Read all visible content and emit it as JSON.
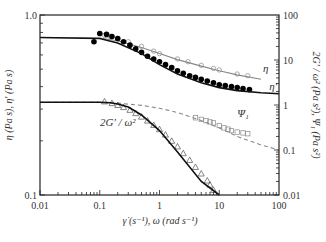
{
  "chart_data": {
    "type": "line",
    "title": "",
    "xlabel": "γ̇ (s⁻¹), ω (rad s⁻¹)",
    "ylabel_left": "η (Pa s), η′ (Pa s)",
    "ylabel_right": "2G′ / ω² (Pa s²), Ψ₁ (Pa s²)",
    "xscale": "log",
    "xlim": [
      0.01,
      100
    ],
    "ylim_left": [
      0.1,
      1.0
    ],
    "ylim_right": [
      0.01,
      100
    ],
    "x_ticks": [
      "0.01",
      "0.1",
      "1",
      "10",
      "100"
    ],
    "y_ticks_left": [
      "0.1",
      "1.0"
    ],
    "y_ticks_right": [
      "0.01",
      "0.1",
      "1",
      "10",
      "100"
    ],
    "grid": false,
    "series": [
      {
        "name": "η",
        "axis": "left",
        "style": "line-gray-with-open-circles",
        "model_x": [
          0.01,
          0.1,
          0.2,
          0.5,
          1,
          2,
          5,
          10,
          20,
          50
        ],
        "model_y": [
          0.75,
          0.745,
          0.72,
          0.66,
          0.61,
          0.565,
          0.52,
          0.49,
          0.465,
          0.44
        ],
        "data_x": [
          0.12,
          0.15,
          0.2,
          0.3,
          0.5,
          0.8,
          1,
          2,
          3,
          5,
          8,
          10,
          20,
          30
        ],
        "data_y": [
          0.77,
          0.76,
          0.74,
          0.71,
          0.67,
          0.63,
          0.61,
          0.57,
          0.55,
          0.525,
          0.505,
          0.495,
          0.47,
          0.46
        ],
        "label": "η"
      },
      {
        "name": "η′",
        "axis": "left",
        "style": "line-black-with-filled-circles",
        "model_x": [
          0.01,
          0.1,
          0.2,
          0.5,
          1,
          2,
          5,
          10,
          20,
          50,
          100
        ],
        "model_y": [
          0.75,
          0.74,
          0.7,
          0.61,
          0.53,
          0.47,
          0.42,
          0.395,
          0.38,
          0.37,
          0.365
        ],
        "data_x": [
          0.08,
          0.1,
          0.13,
          0.16,
          0.2,
          0.25,
          0.32,
          0.4,
          0.5,
          0.63,
          0.8,
          1,
          1.26,
          1.6,
          2,
          2.5,
          3.2,
          4,
          5,
          6.3,
          8,
          10,
          12.6,
          16,
          20,
          25,
          32
        ],
        "data_y": [
          0.71,
          0.79,
          0.78,
          0.76,
          0.74,
          0.71,
          0.68,
          0.65,
          0.62,
          0.59,
          0.57,
          0.55,
          0.53,
          0.51,
          0.49,
          0.475,
          0.46,
          0.45,
          0.44,
          0.43,
          0.42,
          0.41,
          0.405,
          0.4,
          0.395,
          0.39,
          0.385
        ],
        "label": "η′"
      },
      {
        "name": "Ψ₁",
        "axis": "right",
        "style": "dashed-gray-with-open-squares",
        "model_x": [
          0.01,
          0.1,
          0.2,
          0.5,
          1,
          2,
          5,
          10,
          20,
          50,
          100
        ],
        "model_y": [
          1.15,
          1.15,
          1.1,
          0.98,
          0.85,
          0.68,
          0.45,
          0.31,
          0.2,
          0.13,
          0.1
        ],
        "data_x": [
          4,
          5,
          6,
          7,
          8,
          10,
          12,
          14,
          16,
          20,
          25,
          30
        ],
        "data_y": [
          0.52,
          0.48,
          0.45,
          0.42,
          0.4,
          0.35,
          0.31,
          0.29,
          0.27,
          0.25,
          0.24,
          0.23
        ],
        "label": "Ψ₁"
      },
      {
        "name": "2G′/ω²",
        "axis": "right",
        "style": "line-black-with-open-triangles",
        "model_x": [
          0.01,
          0.1,
          0.15,
          0.2,
          0.3,
          0.5,
          1,
          2,
          5,
          10
        ],
        "model_y": [
          1.15,
          1.15,
          1.12,
          1.05,
          0.9,
          0.6,
          0.27,
          0.09,
          0.02,
          0.01
        ],
        "data_x": [
          0.12,
          0.16,
          0.2,
          0.25,
          0.32,
          0.4,
          0.5,
          0.63,
          0.8,
          1,
          1.26,
          1.6,
          2,
          2.5,
          3.2,
          4,
          5,
          6.3,
          7,
          8
        ],
        "data_y": [
          1.2,
          1.1,
          1.0,
          0.9,
          0.78,
          0.66,
          0.55,
          0.45,
          0.36,
          0.29,
          0.22,
          0.16,
          0.12,
          0.085,
          0.06,
          0.042,
          0.03,
          0.021,
          0.017,
          0.013
        ],
        "label": "2G′ / ω²"
      }
    ],
    "annotations": [
      {
        "text": "η",
        "x": 60,
        "y_left": 0.48
      },
      {
        "text": "η′",
        "x": 80,
        "y_left": 0.385
      },
      {
        "text": "Ψ₁",
        "x": 25,
        "y_right": 0.55
      },
      {
        "text": "2G′ / ω²",
        "x": 0.2,
        "y_right": 0.35
      }
    ]
  }
}
